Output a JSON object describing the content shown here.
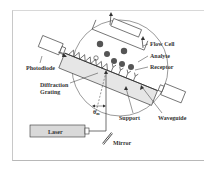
{
  "diagram": {
    "title": "",
    "labels": {
      "flow_cell": "Flow Cell",
      "analyte": "Analyte",
      "receptor": "Receptor",
      "photodiode": "Photodiode",
      "diffraction_grating_line1": "Diffraction",
      "diffraction_grating_line2": "Grating",
      "support": "Support",
      "waveguide": "Waveguide",
      "laser": "Laser",
      "mirror": "Mirror",
      "angle_symbol": "θ",
      "angle_subscript": "m"
    },
    "colors": {
      "line": "#333333",
      "support_fill": "#e6e6e6",
      "laser_fill": "#d9d9d9",
      "particle": "#555555",
      "frame": "#c8c8c8"
    }
  }
}
